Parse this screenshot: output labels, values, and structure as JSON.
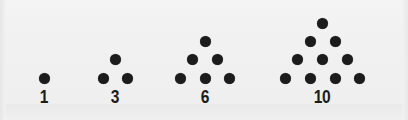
{
  "figure": {
    "name": "triangular-numbers-dot-figure",
    "background_color": "#f2f2f2",
    "dot_color": "#1c1c1c",
    "label_color": "#1c1c1c",
    "dot_diameter_px": 11,
    "row_spacing_px": 18.5,
    "column_spacing_px": 24.5,
    "baseline_y_px": 78
  },
  "groups": [
    {
      "label": "1",
      "rows": 1,
      "dot_count": 1,
      "label_center_x": 44,
      "apex_center_x": 44,
      "dots": [
        {
          "cx": 44,
          "cy": 78
        }
      ]
    },
    {
      "label": "3",
      "rows": 2,
      "dot_count": 3,
      "label_center_x": 115,
      "apex_center_x": 115,
      "dots": [
        {
          "cx": 115,
          "cy": 59
        },
        {
          "cx": 103,
          "cy": 78
        },
        {
          "cx": 127,
          "cy": 78
        }
      ]
    },
    {
      "label": "6",
      "rows": 3,
      "dot_count": 6,
      "label_center_x": 205,
      "apex_center_x": 205,
      "dots": [
        {
          "cx": 205,
          "cy": 41
        },
        {
          "cx": 192,
          "cy": 59
        },
        {
          "cx": 217,
          "cy": 59
        },
        {
          "cx": 180,
          "cy": 78
        },
        {
          "cx": 205,
          "cy": 78
        },
        {
          "cx": 229,
          "cy": 78
        }
      ]
    },
    {
      "label": "10",
      "rows": 4,
      "dot_count": 10,
      "label_center_x": 322,
      "apex_center_x": 322,
      "dots": [
        {
          "cx": 322,
          "cy": 23
        },
        {
          "cx": 310,
          "cy": 41
        },
        {
          "cx": 335,
          "cy": 41
        },
        {
          "cx": 297,
          "cy": 59
        },
        {
          "cx": 322,
          "cy": 59
        },
        {
          "cx": 347,
          "cy": 59
        },
        {
          "cx": 285,
          "cy": 78
        },
        {
          "cx": 310,
          "cy": 78
        },
        {
          "cx": 335,
          "cy": 78
        },
        {
          "cx": 359,
          "cy": 78
        }
      ]
    }
  ],
  "chart_data": {
    "type": "scatter",
    "title": "",
    "subtitle": "",
    "xlabel": "",
    "ylabel": "",
    "categories": [
      "1",
      "3",
      "6",
      "10"
    ],
    "values": [
      1,
      3,
      6,
      10
    ],
    "series": [
      {
        "name": "triangular numbers",
        "values": [
          1,
          3,
          6,
          10
        ]
      },
      {
        "name": "rows per figure",
        "values": [
          1,
          2,
          3,
          4
        ]
      }
    ],
    "annotations": [
      "1",
      "3",
      "6",
      "10"
    ],
    "grid": false,
    "legend": "none"
  }
}
